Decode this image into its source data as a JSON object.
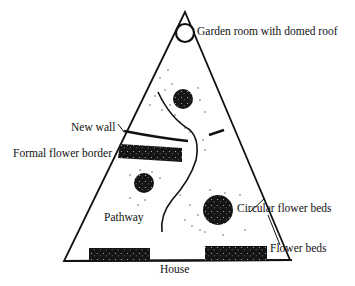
{
  "diagram": {
    "type": "garden-plan",
    "colors": {
      "ink": "#111111",
      "background": "#ffffff"
    },
    "labels": {
      "garden_room": "Garden room with domed roof",
      "new_wall": "New wall",
      "formal_border": "Formal flower border",
      "pathway": "Pathway",
      "circular_beds": "Circular flower beds",
      "flower_beds": "Flower beds",
      "house": "House"
    }
  }
}
